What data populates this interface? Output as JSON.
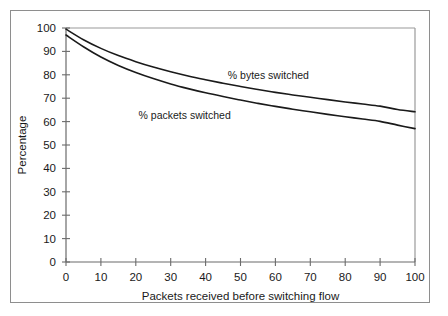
{
  "chart_data": {
    "type": "line",
    "title": "",
    "xlabel": "Packets received before switching flow",
    "ylabel": "Percentage",
    "xlim": [
      0,
      100
    ],
    "ylim": [
      0,
      100
    ],
    "xticks": [
      0,
      10,
      20,
      30,
      40,
      50,
      60,
      70,
      80,
      90,
      100
    ],
    "yticks": [
      0,
      10,
      20,
      30,
      40,
      50,
      60,
      70,
      80,
      90,
      100
    ],
    "xtick_labels": [
      "0",
      "10",
      "20",
      "30",
      "40",
      "50",
      "60",
      "70",
      "80",
      "90",
      "100"
    ],
    "ytick_labels": [
      "0",
      "10",
      "20",
      "30",
      "40",
      "50",
      "60",
      "70",
      "80",
      "90",
      "100"
    ],
    "grid": false,
    "legend": "inline-annotations",
    "line_color": "#1a1a1a",
    "frame_color": "#9a9a9a",
    "x": [
      0,
      5,
      10,
      15,
      20,
      25,
      30,
      35,
      40,
      45,
      50,
      55,
      60,
      65,
      70,
      75,
      80,
      85,
      90,
      95,
      100
    ],
    "series": [
      {
        "name": "% bytes switched",
        "label": "% bytes switched",
        "values": [
          99.5,
          95.0,
          91.3,
          88.2,
          85.6,
          83.3,
          81.3,
          79.5,
          77.9,
          76.4,
          75.0,
          73.7,
          72.5,
          71.4,
          70.4,
          69.4,
          68.4,
          67.5,
          66.6,
          65.2,
          64.2
        ],
        "label_x": 58,
        "label_y": 78
      },
      {
        "name": "% packets switched",
        "label": "% packets switched",
        "values": [
          97.0,
          92.0,
          87.6,
          84.0,
          81.0,
          78.4,
          76.1,
          74.1,
          72.3,
          70.7,
          69.2,
          67.8,
          66.5,
          65.3,
          64.2,
          63.1,
          62.1,
          61.1,
          60.1,
          58.5,
          57.0
        ],
        "label_x": 34,
        "label_y": 61
      }
    ],
    "annotations": [
      {
        "text": "% bytes switched",
        "x": 58,
        "y": 78
      },
      {
        "text": "% packets switched",
        "x": 34,
        "y": 61
      }
    ]
  }
}
